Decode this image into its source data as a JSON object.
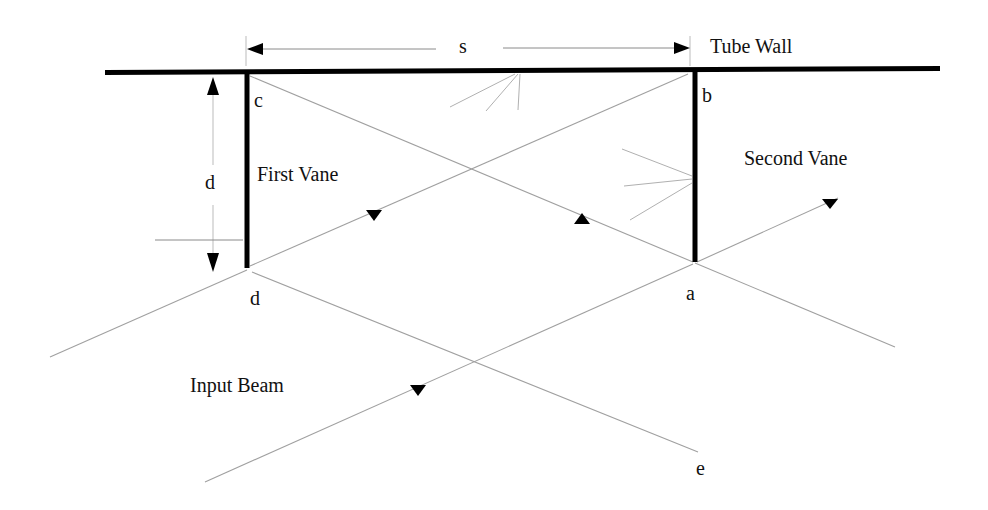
{
  "diagram": {
    "labels": {
      "s": "s",
      "tube_wall": "Tube Wall",
      "c": "c",
      "b": "b",
      "d_dimension": "d",
      "first_vane": "First Vane",
      "second_vane": "Second Vane",
      "d_point": "d",
      "a": "a",
      "input_beam": "Input Beam",
      "e": "e"
    },
    "colors": {
      "wall": "#000000",
      "beam": "#9a9a9a",
      "dimension": "#8a8a8a",
      "arrow": "#000000",
      "text": "#111111"
    },
    "points": {
      "c": [
        247,
        75
      ],
      "b": [
        690,
        73
      ],
      "d": [
        247,
        268
      ],
      "a": [
        695,
        262
      ],
      "e": [
        698,
        452
      ]
    },
    "elements": {
      "tube_wall": {
        "x1": 105,
        "y1": 72,
        "x2": 940,
        "y2": 69
      },
      "first_vane": {
        "x": 247,
        "y1": 72,
        "y2": 268
      },
      "second_vane": {
        "x": 695,
        "y1": 70,
        "y2": 262
      },
      "s_dimension": {
        "x1": 247,
        "x2": 690,
        "y": 47
      },
      "d_dimension": {
        "x": 213,
        "y1": 77,
        "y2": 270
      }
    }
  }
}
